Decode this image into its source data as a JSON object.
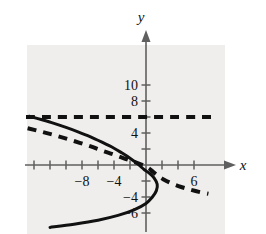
{
  "figure": {
    "name": "parabola-and-asymptote-graph",
    "background_color": "#ffffff",
    "panel_color": "#efeeec",
    "curve_color": "#111111",
    "axis_color": "#5f5f5f",
    "axis_labels": {
      "x": "x",
      "y": "y"
    },
    "y_tick_labels": [
      "10",
      "8",
      "4",
      "−4",
      "−6"
    ],
    "x_tick_labels": [
      "−8",
      "−4",
      "6"
    ]
  },
  "chart_data": {
    "type": "line",
    "title": "",
    "xlabel": "x",
    "ylabel": "y",
    "xlim": [
      -15,
      9
    ],
    "ylim": [
      -7.5,
      11.5
    ],
    "grid": false,
    "legend": "none",
    "x_ticks": [
      -14,
      -12,
      -10,
      -8,
      -6,
      -4,
      -2,
      2,
      4,
      6
    ],
    "x_tick_labels_shown": {
      "-8": "−8",
      "-4": "−4",
      "6": "6"
    },
    "y_ticks": [
      -6,
      -4,
      -2,
      2,
      4,
      6,
      8,
      10
    ],
    "y_tick_labels_shown": {
      "10": "10",
      "8": "8",
      "4": "4",
      "-4": "−4",
      "-6": "−6"
    },
    "series": [
      {
        "name": "solid-parabola",
        "style": "solid",
        "width": 3,
        "color": "#111111",
        "description": "leftward-opening parabola, vertex near (1.5, -1)",
        "points": [
          [
            -14.6,
            6.1
          ],
          [
            -13.0,
            5.65
          ],
          [
            -11.5,
            5.2
          ],
          [
            -10.0,
            4.7
          ],
          [
            -8.5,
            4.15
          ],
          [
            -7.0,
            3.55
          ],
          [
            -5.5,
            2.85
          ],
          [
            -4.0,
            2.1
          ],
          [
            -3.0,
            1.5
          ],
          [
            -2.0,
            0.85
          ],
          [
            -1.0,
            0.1
          ],
          [
            -0.2,
            -0.6
          ],
          [
            0.4,
            -1.0
          ],
          [
            1.0,
            -1.6
          ],
          [
            1.4,
            -2.4
          ],
          [
            1.3,
            -3.2
          ],
          [
            0.8,
            -4.0
          ],
          [
            0.0,
            -4.8
          ],
          [
            -1.5,
            -5.6
          ],
          [
            -3.5,
            -6.3
          ],
          [
            -6.0,
            -6.9
          ],
          [
            -9.0,
            -7.4
          ],
          [
            -12.0,
            -7.8
          ]
        ]
      },
      {
        "name": "horizontal-asymptote",
        "style": "dashed",
        "width": 4,
        "color": "#111111",
        "description": "horizontal dashed line y = 6",
        "y_value": 6,
        "points": [
          [
            -15.0,
            6.0
          ],
          [
            9.0,
            6.0
          ]
        ]
      },
      {
        "name": "dashed-decreasing-curve",
        "style": "dashed",
        "width": 4,
        "color": "#111111",
        "description": "decreasing dashed curve from upper-left through near origin to lower-right",
        "points": [
          [
            -14.8,
            4.6
          ],
          [
            -13.0,
            4.15
          ],
          [
            -11.0,
            3.6
          ],
          [
            -9.0,
            3.0
          ],
          [
            -7.0,
            2.35
          ],
          [
            -5.5,
            1.8
          ],
          [
            -4.0,
            1.3
          ],
          [
            -2.5,
            0.75
          ],
          [
            -1.2,
            0.3
          ],
          [
            -0.2,
            -0.1
          ],
          [
            0.6,
            -0.6
          ],
          [
            1.3,
            -1.2
          ],
          [
            2.2,
            -1.8
          ],
          [
            3.2,
            -2.3
          ],
          [
            4.4,
            -2.75
          ],
          [
            5.6,
            -3.1
          ],
          [
            6.8,
            -3.4
          ],
          [
            7.8,
            -3.6
          ]
        ]
      }
    ]
  }
}
